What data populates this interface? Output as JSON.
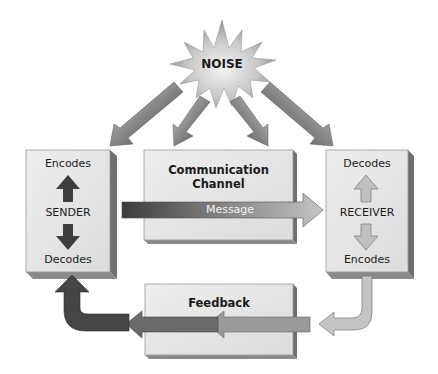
{
  "noise": {
    "label": "NOISE"
  },
  "sender": {
    "top_label": "Encodes",
    "center_label": "SENDER",
    "bottom_label": "Decodes"
  },
  "channel": {
    "title_line1": "Communication",
    "title_line2": "Channel",
    "arrow_label": "Message"
  },
  "receiver": {
    "top_label": "Decodes",
    "center_label": "RECEIVER",
    "bottom_label": "Encodes"
  },
  "feedback": {
    "title": "Feedback"
  },
  "colors": {
    "face": "#e6e6e6",
    "side": "#6f6f6f",
    "arrow_dark": "#4a4a4a",
    "arrow_light": "#bdbdbd"
  }
}
